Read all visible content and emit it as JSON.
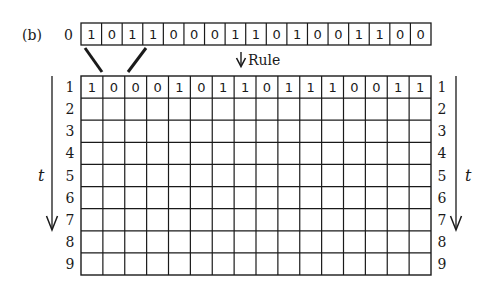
{
  "figure": {
    "panel_label": "(b)",
    "rule_label": "Rule",
    "time_axis_label": "t",
    "initial_row": {
      "index_label": "0",
      "cells": [
        1,
        0,
        1,
        1,
        0,
        0,
        0,
        1,
        1,
        0,
        1,
        0,
        0,
        1,
        1,
        0,
        0
      ]
    },
    "grid": {
      "row_labels": [
        "1",
        "2",
        "3",
        "4",
        "5",
        "6",
        "7",
        "8",
        "9"
      ],
      "columns": 16,
      "rows": [
        [
          1,
          0,
          0,
          0,
          1,
          0,
          1,
          1,
          0,
          1,
          1,
          1,
          0,
          0,
          1,
          1
        ],
        [],
        [],
        [],
        [],
        [],
        [],
        [],
        []
      ]
    },
    "colors": {
      "line": "#1a1a1a",
      "background": "#ffffff"
    }
  }
}
